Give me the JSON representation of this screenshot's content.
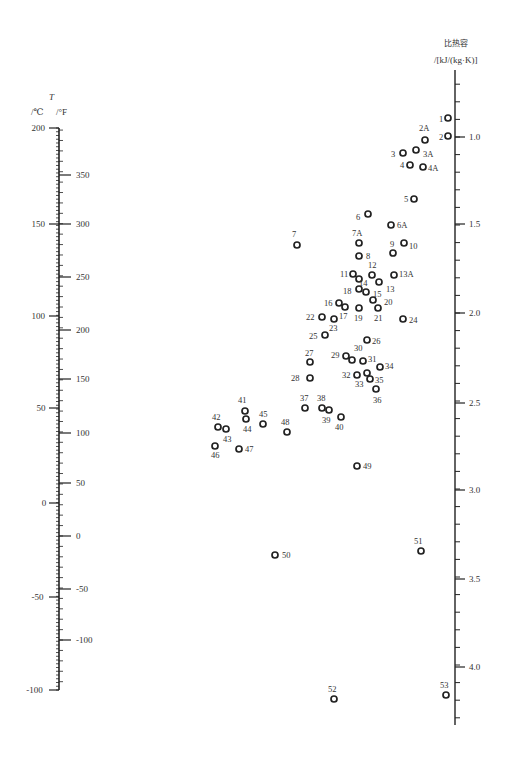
{
  "chart_data": {
    "type": "scatter",
    "left_axis": {
      "label_T": "T",
      "unit_c": "/℃",
      "unit_f": "/°F",
      "celsius_ticks": [
        {
          "label": "200",
          "y": 128
        },
        {
          "label": "150",
          "y": 224
        },
        {
          "label": "100",
          "y": 316
        },
        {
          "label": "50",
          "y": 408
        },
        {
          "label": "0",
          "y": 503
        },
        {
          "label": "-50",
          "y": 597
        },
        {
          "label": "-100",
          "y": 690
        }
      ],
      "fahrenheit_ticks": [
        {
          "label": "350",
          "y": 175
        },
        {
          "label": "300",
          "y": 224
        },
        {
          "label": "250",
          "y": 277
        },
        {
          "label": "200",
          "y": 330
        },
        {
          "label": "150",
          "y": 379
        },
        {
          "label": "100",
          "y": 433
        },
        {
          "label": "50",
          "y": 483
        },
        {
          "label": "0",
          "y": 536
        },
        {
          "label": "-50",
          "y": 589
        },
        {
          "label": "-100",
          "y": 640
        }
      ],
      "range_c": [
        -100,
        200
      ]
    },
    "right_axis": {
      "title": "比热容",
      "unit": "/[kJ/(kg·K)]",
      "ticks": [
        {
          "label": "1.0",
          "y": 137
        },
        {
          "label": "1.5",
          "y": 224
        },
        {
          "label": "2.0",
          "y": 313
        },
        {
          "label": "2.5",
          "y": 403
        },
        {
          "label": "3.0",
          "y": 490
        },
        {
          "label": "3.5",
          "y": 579
        },
        {
          "label": "4.0",
          "y": 667
        }
      ],
      "range": [
        0.7,
        4.3
      ]
    },
    "points": [
      {
        "id": "1",
        "x": 448,
        "y": 118,
        "lx": -9,
        "ly": -4
      },
      {
        "id": "2",
        "x": 448,
        "y": 136,
        "lx": -9,
        "ly": -4
      },
      {
        "id": "2A",
        "x": 425,
        "y": 140,
        "lx": -6,
        "ly": -17
      },
      {
        "id": "3",
        "x": 403,
        "y": 153,
        "lx": -12,
        "ly": -4
      },
      {
        "id": "3A",
        "x": 416,
        "y": 150,
        "lx": 7,
        "ly": -1
      },
      {
        "id": "4",
        "x": 410,
        "y": 165,
        "lx": -10,
        "ly": -5
      },
      {
        "id": "4A",
        "x": 423,
        "y": 167,
        "lx": 5,
        "ly": -4
      },
      {
        "id": "5",
        "x": 414,
        "y": 199,
        "lx": -10,
        "ly": -5
      },
      {
        "id": "6",
        "x": 368,
        "y": 214,
        "lx": -12,
        "ly": -2
      },
      {
        "id": "6A",
        "x": 391,
        "y": 225,
        "lx": 6,
        "ly": -5
      },
      {
        "id": "7",
        "x": 297,
        "y": 245,
        "lx": -5,
        "ly": -16
      },
      {
        "id": "7A",
        "x": 359,
        "y": 243,
        "lx": -7,
        "ly": -15
      },
      {
        "id": "8",
        "x": 359,
        "y": 256,
        "lx": 7,
        "ly": -5
      },
      {
        "id": "9",
        "x": 393,
        "y": 253,
        "lx": -3,
        "ly": -14
      },
      {
        "id": "10",
        "x": 404,
        "y": 243,
        "lx": 5,
        "ly": -2
      },
      {
        "id": "11",
        "x": 353,
        "y": 274,
        "lx": -13,
        "ly": -5
      },
      {
        "id": "12",
        "x": 372,
        "y": 275,
        "lx": -4,
        "ly": -15
      },
      {
        "id": "13",
        "x": 379,
        "y": 282,
        "lx": 7,
        "ly": 2
      },
      {
        "id": "13A",
        "x": 394,
        "y": 275,
        "lx": 5,
        "ly": -6
      },
      {
        "id": "14",
        "x": 359,
        "y": 279,
        "lx": 0,
        "ly": -1
      },
      {
        "id": "15",
        "x": 366,
        "y": 292,
        "lx": 7,
        "ly": -3
      },
      {
        "id": "16",
        "x": 339,
        "y": 303,
        "lx": -15,
        "ly": -5
      },
      {
        "id": "17",
        "x": 345,
        "y": 307,
        "lx": -6,
        "ly": 4
      },
      {
        "id": "18",
        "x": 359,
        "y": 289,
        "lx": -16,
        "ly": -3
      },
      {
        "id": "19",
        "x": 359,
        "y": 308,
        "lx": -5,
        "ly": 5
      },
      {
        "id": "20",
        "x": 373,
        "y": 300,
        "lx": 11,
        "ly": -3
      },
      {
        "id": "21",
        "x": 378,
        "y": 308,
        "lx": -4,
        "ly": 5
      },
      {
        "id": "22",
        "x": 322,
        "y": 317,
        "lx": -16,
        "ly": -5
      },
      {
        "id": "23",
        "x": 334,
        "y": 319,
        "lx": -5,
        "ly": 4
      },
      {
        "id": "24",
        "x": 403,
        "y": 319,
        "lx": 6,
        "ly": -4
      },
      {
        "id": "25",
        "x": 325,
        "y": 335,
        "lx": -16,
        "ly": -4
      },
      {
        "id": "26",
        "x": 367,
        "y": 340,
        "lx": 5,
        "ly": -4
      },
      {
        "id": "27",
        "x": 310,
        "y": 362,
        "lx": -5,
        "ly": -14
      },
      {
        "id": "28",
        "x": 310,
        "y": 378,
        "lx": -19,
        "ly": -5
      },
      {
        "id": "29",
        "x": 346,
        "y": 356,
        "lx": -15,
        "ly": -6
      },
      {
        "id": "30",
        "x": 352,
        "y": 360,
        "lx": 2,
        "ly": -17
      },
      {
        "id": "31",
        "x": 363,
        "y": 361,
        "lx": 5,
        "ly": -7
      },
      {
        "id": "32",
        "x": 357,
        "y": 375,
        "lx": -15,
        "ly": -5
      },
      {
        "id": "33",
        "x": 367,
        "y": 373,
        "lx": -12,
        "ly": 6
      },
      {
        "id": "34",
        "x": 380,
        "y": 367,
        "lx": 5,
        "ly": -6
      },
      {
        "id": "35",
        "x": 370,
        "y": 379,
        "lx": 5,
        "ly": -4
      },
      {
        "id": "36",
        "x": 376,
        "y": 389,
        "lx": -3,
        "ly": 6
      },
      {
        "id": "37",
        "x": 305,
        "y": 408,
        "lx": -5,
        "ly": -15
      },
      {
        "id": "38",
        "x": 322,
        "y": 408,
        "lx": -5,
        "ly": -15
      },
      {
        "id": "39",
        "x": 329,
        "y": 410,
        "lx": -7,
        "ly": 5
      },
      {
        "id": "40",
        "x": 341,
        "y": 417,
        "lx": -6,
        "ly": 5
      },
      {
        "id": "41",
        "x": 245,
        "y": 411,
        "lx": -7,
        "ly": -16
      },
      {
        "id": "42",
        "x": 218,
        "y": 427,
        "lx": -6,
        "ly": -15
      },
      {
        "id": "43",
        "x": 226,
        "y": 429,
        "lx": -3,
        "ly": 5
      },
      {
        "id": "44",
        "x": 246,
        "y": 419,
        "lx": -3,
        "ly": 5
      },
      {
        "id": "45",
        "x": 263,
        "y": 424,
        "lx": -4,
        "ly": -15
      },
      {
        "id": "46",
        "x": 215,
        "y": 446,
        "lx": -4,
        "ly": 4
      },
      {
        "id": "47",
        "x": 239,
        "y": 449,
        "lx": 6,
        "ly": -5
      },
      {
        "id": "48",
        "x": 287,
        "y": 432,
        "lx": -6,
        "ly": -15
      },
      {
        "id": "49",
        "x": 357,
        "y": 466,
        "lx": 6,
        "ly": -5
      },
      {
        "id": "50",
        "x": 275,
        "y": 555,
        "lx": 7,
        "ly": -5
      },
      {
        "id": "51",
        "x": 421,
        "y": 551,
        "lx": -7,
        "ly": -15
      },
      {
        "id": "52",
        "x": 334,
        "y": 699,
        "lx": -6,
        "ly": -15
      },
      {
        "id": "53",
        "x": 446,
        "y": 695,
        "lx": -6,
        "ly": -15
      }
    ]
  }
}
